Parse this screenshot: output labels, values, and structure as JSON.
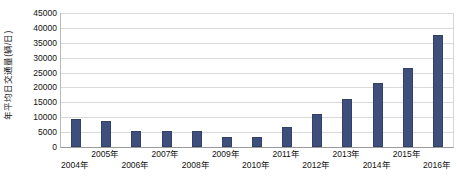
{
  "chart_data": {
    "type": "bar",
    "title": "",
    "subtitle": "",
    "xlabel": "",
    "ylabel": "年平均日交通量(辆/日)",
    "ylim": [
      0,
      45000
    ],
    "xlim_note": "categorical",
    "grid": "horizontal",
    "legend": "none",
    "legend_position": "none",
    "bar_color": "#3E4F7C",
    "gridline_color": "#D9D9D9",
    "axis_color": "#9A9A9A",
    "y_ticks": [
      0,
      5000,
      10000,
      15000,
      20000,
      25000,
      30000,
      35000,
      40000,
      45000
    ],
    "y_tick_labels": [
      "0",
      "5000",
      "10000",
      "15000",
      "20000",
      "25000",
      "30000",
      "35000",
      "40000",
      "45000"
    ],
    "categories": [
      "2004年",
      "2005年",
      "2006年",
      "2007年",
      "2008年",
      "2009年",
      "2010年",
      "2011年",
      "2012年",
      "2013年",
      "2014年",
      "2015年",
      "2016年"
    ],
    "values": [
      9400,
      8800,
      5500,
      5400,
      5300,
      3300,
      3300,
      6800,
      11000,
      16000,
      21500,
      26500,
      37500
    ],
    "x_label_layout": "staggered-two-rows",
    "annotations": []
  },
  "axis": {
    "y_title": "年平均日交通量(辆/日)"
  }
}
